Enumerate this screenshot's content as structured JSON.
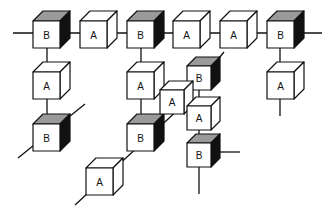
{
  "diagram": {
    "title": "",
    "colors": {
      "background": "#ffffff",
      "stroke": "#111111",
      "front_face": "#ffffff",
      "A_top": "#ffffff",
      "A_side": "#ffffff",
      "B_top": "#9a9a9a",
      "B_side": "#111111"
    },
    "cubes": [
      {
        "id": "c1",
        "label": "B",
        "x": 33,
        "y": 21,
        "s": 27
      },
      {
        "id": "c2",
        "label": "A",
        "x": 80,
        "y": 21,
        "s": 27
      },
      {
        "id": "c3",
        "label": "B",
        "x": 127,
        "y": 21,
        "s": 27
      },
      {
        "id": "c4",
        "label": "A",
        "x": 173,
        "y": 21,
        "s": 27
      },
      {
        "id": "c5",
        "label": "A",
        "x": 220,
        "y": 21,
        "s": 27
      },
      {
        "id": "c6",
        "label": "B",
        "x": 267,
        "y": 21,
        "s": 27
      },
      {
        "id": "c7",
        "label": "A",
        "x": 33,
        "y": 72,
        "s": 27
      },
      {
        "id": "c8",
        "label": "B",
        "x": 33,
        "y": 124,
        "s": 27
      },
      {
        "id": "c9",
        "label": "A",
        "x": 127,
        "y": 72,
        "s": 27
      },
      {
        "id": "c10",
        "label": "B",
        "x": 127,
        "y": 124,
        "s": 27
      },
      {
        "id": "c11",
        "label": "A",
        "x": 86,
        "y": 168,
        "s": 27
      },
      {
        "id": "c12",
        "label": "B",
        "x": 187,
        "y": 66,
        "s": 24
      },
      {
        "id": "c13",
        "label": "A",
        "x": 160,
        "y": 90,
        "s": 24
      },
      {
        "id": "c14",
        "label": "A",
        "x": 187,
        "y": 106,
        "s": 24
      },
      {
        "id": "c15",
        "label": "B",
        "x": 187,
        "y": 143,
        "s": 24
      },
      {
        "id": "c16",
        "label": "A",
        "x": 267,
        "y": 72,
        "s": 27
      }
    ],
    "lines": [
      {
        "x1": 13,
        "y1": 33,
        "x2": 322,
        "y2": 33
      },
      {
        "x1": 47,
        "y1": 47,
        "x2": 47,
        "y2": 72
      },
      {
        "x1": 47,
        "y1": 98,
        "x2": 47,
        "y2": 124
      },
      {
        "x1": 18,
        "y1": 158,
        "x2": 85,
        "y2": 104
      },
      {
        "x1": 141,
        "y1": 47,
        "x2": 141,
        "y2": 72
      },
      {
        "x1": 141,
        "y1": 98,
        "x2": 141,
        "y2": 124
      },
      {
        "x1": 75,
        "y1": 205,
        "x2": 180,
        "y2": 108
      },
      {
        "x1": 280,
        "y1": 47,
        "x2": 280,
        "y2": 72
      },
      {
        "x1": 280,
        "y1": 98,
        "x2": 280,
        "y2": 116
      },
      {
        "x1": 199,
        "y1": 90,
        "x2": 199,
        "y2": 106
      },
      {
        "x1": 199,
        "y1": 130,
        "x2": 199,
        "y2": 143
      },
      {
        "x1": 199,
        "y1": 167,
        "x2": 199,
        "y2": 194
      },
      {
        "x1": 211,
        "y1": 152,
        "x2": 240,
        "y2": 152
      },
      {
        "x1": 176,
        "y1": 110,
        "x2": 224,
        "y2": 52
      }
    ]
  }
}
